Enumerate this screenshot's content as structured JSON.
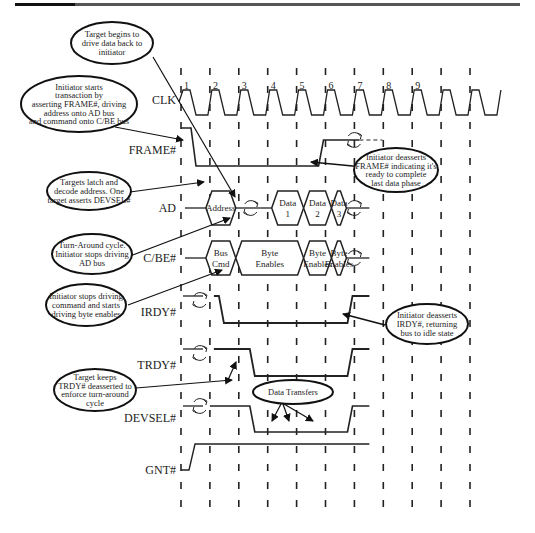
{
  "header": {
    "bar_color": "#555555"
  },
  "diagram": {
    "clock_numbers": [
      "1",
      "2",
      "3",
      "4",
      "5",
      "6",
      "7",
      "8",
      "9"
    ],
    "signals": [
      {
        "id": "clk",
        "label": "CLK"
      },
      {
        "id": "frame",
        "label": "FRAME#"
      },
      {
        "id": "ad",
        "label": "AD"
      },
      {
        "id": "cbe",
        "label": "C/BE#"
      },
      {
        "id": "irdy",
        "label": "IRDY#"
      },
      {
        "id": "trdy",
        "label": "TRDY#"
      },
      {
        "id": "devsel",
        "label": "DEVSEL#"
      },
      {
        "id": "gnt",
        "label": "GNT#"
      }
    ],
    "ad_segments": [
      {
        "line1": "Address",
        "line2": ""
      },
      {
        "line1": "Data",
        "line2": "1"
      },
      {
        "line1": "Data",
        "line2": "2"
      },
      {
        "line1": "Data",
        "line2": "3"
      }
    ],
    "cbe_segments": [
      {
        "line1": "Bus",
        "line2": "Cmd"
      },
      {
        "line1": "Byte",
        "line2": "Enables"
      },
      {
        "line1": "Byte",
        "line2": "Enables"
      },
      {
        "line1": "Byte",
        "line2": "Enables"
      }
    ],
    "annotations": [
      {
        "id": "target-drive",
        "lines": [
          "Target begins to",
          "drive data back to",
          "initiator"
        ]
      },
      {
        "id": "initiator-starts",
        "lines": [
          "Initiator starts",
          "transaction by",
          "asserting FRAME#, driving",
          "address onto AD bus",
          "and command onto C/BE bus"
        ]
      },
      {
        "id": "targets-latch",
        "lines": [
          "Targets latch and",
          "decode address. One",
          "target asserts DEVSEL#"
        ]
      },
      {
        "id": "turnaround",
        "lines": [
          "Turn-Around cycle.",
          "Initiator stops driving",
          "AD bus"
        ]
      },
      {
        "id": "initiator-stops-cmd",
        "lines": [
          "Initiator stops driving",
          "command and starts",
          "driving byte enables"
        ]
      },
      {
        "id": "target-keeps-trdy",
        "lines": [
          "Target keeps",
          "TRDY# deasserted to",
          "enforce turn-around",
          "cycle"
        ]
      },
      {
        "id": "frame-deassert",
        "lines": [
          "Initiator deasserts",
          "FRAME# indicating it's",
          "ready to complete",
          "last data phase"
        ]
      },
      {
        "id": "irdy-deassert",
        "lines": [
          "Initiator deasserts",
          "IRDY#, returning",
          "bus to idle state"
        ]
      },
      {
        "id": "data-transfers",
        "lines": [
          "Data Transfers"
        ]
      }
    ]
  }
}
